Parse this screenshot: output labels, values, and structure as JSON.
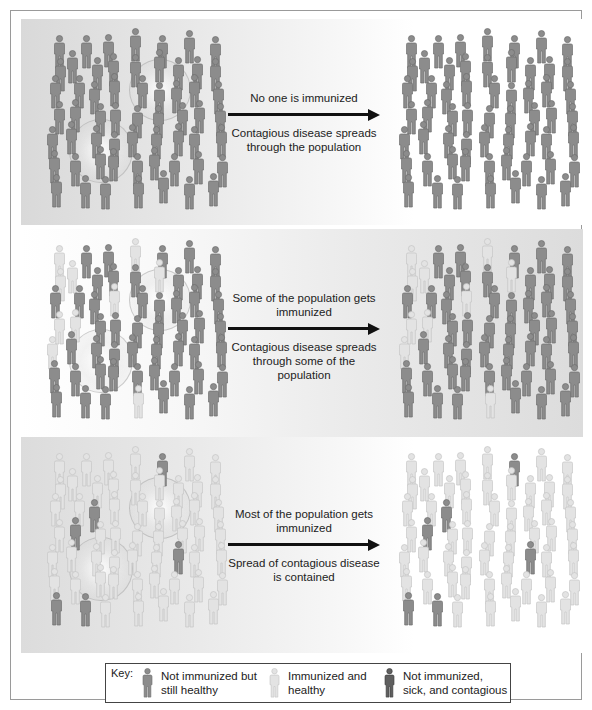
{
  "colors": {
    "not_immunized_healthy": "#8c8c8c",
    "immunized_healthy": "#e3e3e3",
    "sick_contagious": "#5f5f5f",
    "arrow": "#111111",
    "frame_border": "#9a9a9a"
  },
  "rows": [
    {
      "id": "no-immunization",
      "caption_top": "No one is immunized",
      "caption_bottom": "Contagious disease spreads through the population",
      "left_crowd": "all not-immunized, healthy",
      "right_crowd": "all not-immunized, sick and contagious"
    },
    {
      "id": "some-immunization",
      "caption_top": "Some of the population gets immunized",
      "caption_bottom": "Contagious disease spreads through some of the population",
      "left_crowd": "mostly not-immunized, a few immunized",
      "right_crowd": "most not-immunized become sick; immunized remain healthy"
    },
    {
      "id": "most-immunization",
      "caption_top": "Most of the population gets immunized",
      "caption_bottom": "Spread of contagious disease is contained",
      "left_crowd": "mostly immunized, a few not-immunized",
      "right_crowd": "mostly immunized healthy; few not-immunized"
    }
  ],
  "key": {
    "label": "Key:",
    "items": [
      {
        "icon": "person-dark-gray-icon",
        "line1": "Not immunized but",
        "line2": "still healthy"
      },
      {
        "icon": "person-light-gray-icon",
        "line1": "Immunized and",
        "line2": "healthy"
      },
      {
        "icon": "person-outlined-dark-icon",
        "line1": "Not immunized,",
        "line2": "sick, and contagious"
      }
    ]
  }
}
